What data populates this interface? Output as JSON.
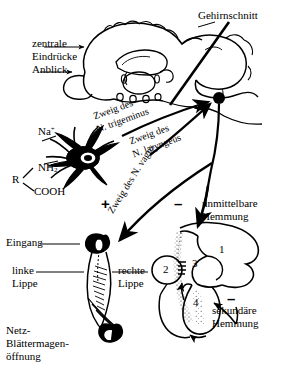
{
  "figure": {
    "title_text": "",
    "language": "de",
    "line_color": "#000000",
    "background": "#ffffff"
  },
  "labels": {
    "gehirnschnitt": "Gehirnschnitt",
    "zentrale_eindruecke_l1": "zentrale",
    "zentrale_eindruecke_l2": "Eindrücke",
    "anblick": "Anblick",
    "zweig_trigeminus_l1": "Zweig des",
    "zweig_trigeminus_l2": "N. trigeminus",
    "zweig_laryngeus_l1": "Zweig des",
    "zweig_laryngeus_l2": "N. laryngeus",
    "zweig_vagus": "Zweig des N. vagus",
    "unmittelbare_l1": "unmittelbare",
    "unmittelbare_l2": "Hemmung",
    "sekundaere_l1": "sekundäre",
    "sekundaere_l2": "Hemmung",
    "eingang": "Eingang",
    "linke_lippe_l1": "linke",
    "linke_lippe_l2": "Lippe",
    "rechte_lippe_l1": "rechte",
    "rechte_lippe_l2": "Lippe",
    "netz_l1": "Netz-",
    "netz_l2": "Blättermagen-",
    "netz_l3": "öffnung"
  },
  "chemical": {
    "sodium": "Na",
    "sodium_charge": "+",
    "amine": "NH",
    "amine_sub": "2",
    "residue": "R",
    "carboxyl": "COOH"
  },
  "signs": {
    "excitatory": "+",
    "inhibitory_direct": "–",
    "inhibitory_secondary": "–"
  },
  "stomach_compartments": {
    "one": "1",
    "two": "2",
    "three": "3",
    "four": "4"
  }
}
